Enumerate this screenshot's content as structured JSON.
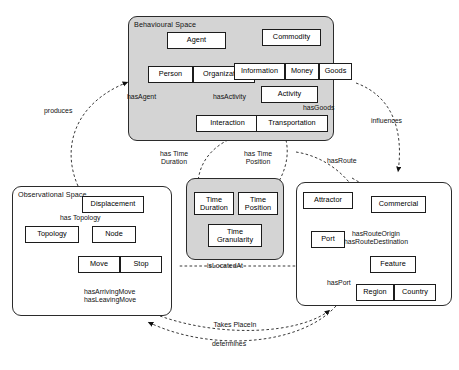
{
  "figure": {
    "bottom_caption": ""
  },
  "panels": {
    "behavioural": {
      "label": "Behavioural Space",
      "fill": "#d4d4d4"
    },
    "observational": {
      "label": "Observational Space",
      "fill": "#ffffff"
    },
    "time": {
      "label": "",
      "fill": "#d4d4d4"
    },
    "spatial": {
      "label": "",
      "fill": "#ffffff"
    }
  },
  "nodes": {
    "agent": "Agent",
    "person": "Person",
    "organization": "Organization",
    "commodity": "Commodity",
    "information": "Information",
    "money": "Money",
    "goods": "Goods",
    "activity": "Activity",
    "interaction": "Interaction",
    "transportation": "Transportation",
    "displacement": "Displacement",
    "topology": "Topology",
    "node": "Node",
    "move": "Move",
    "stop": "Stop",
    "time_duration": "Time Duration",
    "time_position": "Time Position",
    "time_granularity": "Time Granularity",
    "attractor": "Attractor",
    "commercial": "Commercial",
    "port": "Port",
    "feature": "Feature",
    "region": "Region",
    "country": "Country"
  },
  "edge_labels": {
    "produces": "produces",
    "has_agent": "hasAgent",
    "has_activity": "hasActivity",
    "has_goods": "hasGoods",
    "influences": "influences",
    "has_time_duration": "has Time Duration",
    "has_time_position": "has Time Position",
    "has_route": "hasRoute",
    "has_topology": "has Topology",
    "is_located_at": "isLocatedAt",
    "has_arriving_move": "hasArrivingMove",
    "has_leaving_move": "hasLeavingMove",
    "has_route_origin": "hasRouteOrigin",
    "has_route_destination": "hasRouteDestination",
    "has_port": "hasPort",
    "takes_place_in": "Takes PlaceIn",
    "determines": "determines"
  },
  "colors": {
    "panel_shaded": "#d4d4d4",
    "node_fill": "#ffffff",
    "stroke": "#1c1c1c",
    "dashed_stroke": "#3a3a3a"
  }
}
